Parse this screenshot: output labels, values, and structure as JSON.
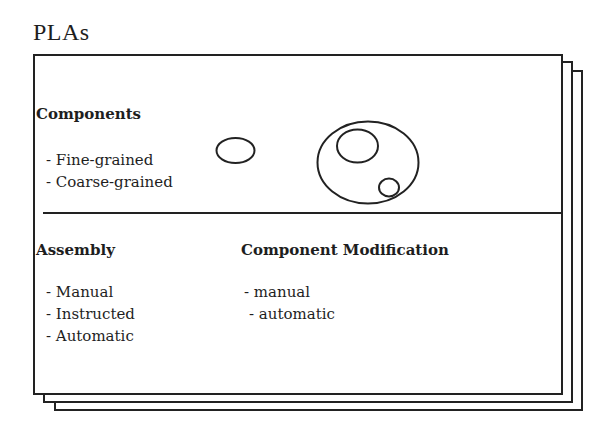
{
  "diagram": {
    "title": "PLAs",
    "stack_count": 3,
    "colors": {
      "line": "#222222",
      "text": "#1e1e1e",
      "background": "#ffffff"
    },
    "components_section": {
      "heading": "Components",
      "items": [
        "- Fine-grained",
        "- Coarse-grained"
      ],
      "illustration": {
        "single_component": "small-ellipse",
        "composite_component": "large-ellipse-containing-two-ellipses"
      }
    },
    "assembly_section": {
      "heading": "Assembly",
      "items": [
        "- Manual",
        "- Instructed",
        "- Automatic"
      ]
    },
    "modification_section": {
      "heading": "Component Modification",
      "items": [
        "- manual",
        "- automatic"
      ]
    }
  }
}
